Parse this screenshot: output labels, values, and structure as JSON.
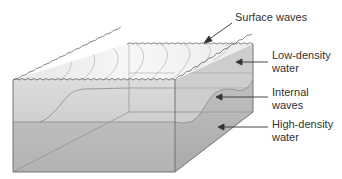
{
  "diagram": {
    "labels": {
      "surface_waves": {
        "line1": "Surface waves"
      },
      "low_density": {
        "line1": "Low-density",
        "line2": "water"
      },
      "internal_waves": {
        "line1": "Internal",
        "line2": "waves"
      },
      "high_density": {
        "line1": "High-density",
        "line2": "water"
      }
    },
    "colors": {
      "surface": "#f2f2f2",
      "low_density_water": "#d6d6d6",
      "high_density_water": "#b9b9b9",
      "right_face_low": "#c4c4c4",
      "right_face_high": "#a9a9a9",
      "edge": "#6e6e6e",
      "leader": "#333333"
    }
  }
}
